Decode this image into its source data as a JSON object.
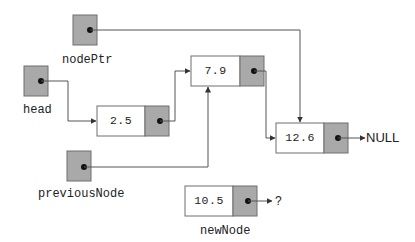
{
  "diagram": {
    "pointers": {
      "nodePtr": {
        "label": "nodePtr"
      },
      "head": {
        "label": "head"
      },
      "previousNode": {
        "label": "previousNode"
      }
    },
    "nodes": [
      {
        "id": "n1",
        "value": "2.5"
      },
      {
        "id": "n2",
        "value": "7.9"
      },
      {
        "id": "n3",
        "value": "12.6"
      }
    ],
    "new_node": {
      "label": "newNode",
      "value": "10.5",
      "next": "?"
    },
    "terminator": "NULL",
    "edges": [
      {
        "from": "head",
        "to": "2.5"
      },
      {
        "from": "2.5",
        "to": "7.9"
      },
      {
        "from": "7.9",
        "to": "12.6"
      },
      {
        "from": "12.6",
        "to": "NULL"
      },
      {
        "from": "nodePtr",
        "to": "12.6"
      },
      {
        "from": "previousNode",
        "to": "7.9"
      },
      {
        "from": "newNode",
        "to": "?"
      }
    ],
    "colors": {
      "pointer_fill": "#a9a9a9",
      "data_fill": "#ffffff",
      "stroke": "#6e6e6e",
      "line": "#555555"
    }
  }
}
